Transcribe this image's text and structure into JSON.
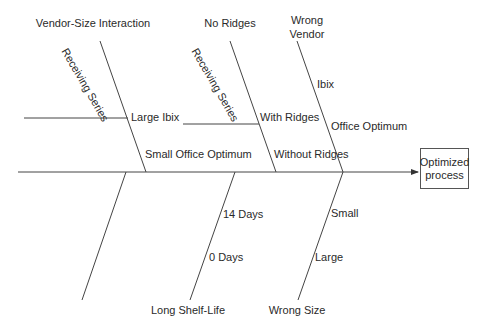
{
  "diagram": {
    "type": "fishbone",
    "effect": {
      "line1": "Optimized",
      "line2": "process"
    },
    "top_categories": [
      {
        "name": "Vendor-Size Interaction",
        "sub_branch_label": "Receiving Series",
        "causes": [
          "Large Ibix",
          "Small Office Optimum"
        ]
      },
      {
        "name": "No Ridges",
        "sub_branch_label": "Receiving Series",
        "causes": [
          "With Ridges",
          "Without Ridges"
        ]
      },
      {
        "name_line1": "Wrong",
        "name_line2": "Vendor",
        "causes": [
          "Ibix",
          "Office Optimum"
        ]
      }
    ],
    "bottom_categories": [
      {
        "name": "",
        "causes": []
      },
      {
        "name": "Long Shelf-Life",
        "causes": [
          "14 Days",
          "0 Days"
        ]
      },
      {
        "name": "Wrong Size",
        "causes": [
          "Small",
          "Large"
        ]
      }
    ],
    "colors": {
      "line": "#444444",
      "text": "#2a2a2a",
      "background": "#ffffff"
    }
  }
}
